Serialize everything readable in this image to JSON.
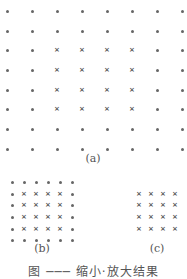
{
  "figure": {
    "panels": [
      {
        "id": "a",
        "label": "(a)",
        "label_pos": [
          93,
          159
        ],
        "cols_x": [
          7,
          32,
          57,
          82,
          107,
          132,
          157,
          182
        ],
        "rows_y": [
          11,
          31,
          50,
          70,
          90,
          109,
          129,
          149
        ],
        "cross_rows": [
          2,
          3,
          4,
          5
        ],
        "cross_cols": [
          2,
          3,
          4,
          5
        ],
        "fill": "dot"
      },
      {
        "id": "b",
        "label": "(b)",
        "label_pos": [
          42,
          248
        ],
        "cols_x": [
          12,
          24,
          36,
          48,
          60,
          72
        ],
        "rows_y": [
          182,
          194,
          205,
          217,
          229,
          240
        ],
        "cross_rows": [
          1,
          2,
          3,
          4
        ],
        "cross_cols": [
          1,
          2,
          3,
          4
        ],
        "fill": "dot"
      },
      {
        "id": "c",
        "label": "(c)",
        "label_pos": [
          157,
          248
        ],
        "cols_x": [
          139,
          151,
          163,
          175
        ],
        "rows_y": [
          194,
          205,
          217,
          229
        ],
        "cross_rows": [
          0,
          1,
          2,
          3
        ],
        "cross_cols": [
          0,
          1,
          2,
          3
        ],
        "fill": "none"
      }
    ],
    "caption": "图 ─── 缩小·放大结果"
  },
  "legend": {
    "dot_glyph": "•",
    "cross_glyph": "×"
  }
}
